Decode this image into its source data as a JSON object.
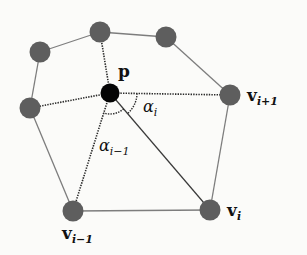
{
  "diagram": {
    "colors": {
      "background": "#fbfbf9",
      "vertex_fill": "#5e5e5e",
      "center_fill": "#050505",
      "solid_edge": "#7d7d7d",
      "dotted_edge": "#2a2a2a"
    },
    "center": {
      "id": "p",
      "label": "p",
      "x": 110,
      "y": 93
    },
    "vertices": [
      {
        "id": "n1",
        "x": 100,
        "y": 32
      },
      {
        "id": "n2",
        "x": 166,
        "y": 37
      },
      {
        "id": "v_ip1",
        "x": 230,
        "y": 95
      },
      {
        "id": "v_i",
        "x": 210,
        "y": 210
      },
      {
        "id": "v_im1",
        "x": 73,
        "y": 211
      },
      {
        "id": "n_left",
        "x": 30,
        "y": 108
      },
      {
        "id": "n_topleft",
        "x": 40,
        "y": 52
      }
    ],
    "labels": {
      "p": "p",
      "v_ip1_main": "v",
      "v_ip1_sub": "i+1",
      "v_i_main": "v",
      "v_i_sub": "i",
      "v_im1_main": "v",
      "v_im1_sub": "i−1",
      "alpha_i_main": "α",
      "alpha_i_sub": "i",
      "alpha_im1_main": "α",
      "alpha_im1_sub": "i−1"
    },
    "edges_solid": [
      [
        "n_topleft",
        "n1"
      ],
      [
        "n1",
        "n2"
      ],
      [
        "n2",
        "v_ip1"
      ],
      [
        "v_ip1",
        "v_i"
      ],
      [
        "v_i",
        "v_im1"
      ],
      [
        "v_im1",
        "n_left"
      ],
      [
        "n_left",
        "n_topleft"
      ]
    ],
    "edges_dotted": [
      [
        "p",
        "n1"
      ],
      [
        "p",
        "v_ip1"
      ],
      [
        "p",
        "v_im1"
      ],
      [
        "p",
        "n_left"
      ]
    ],
    "edges_thin_dark": [
      [
        "p",
        "v_i"
      ]
    ],
    "angles": [
      {
        "name": "alpha_i",
        "between": [
          "v_ip1",
          "v_i"
        ],
        "radius": 27
      },
      {
        "name": "alpha_im1",
        "between": [
          "v_i",
          "v_im1"
        ],
        "radius": 21
      }
    ]
  }
}
